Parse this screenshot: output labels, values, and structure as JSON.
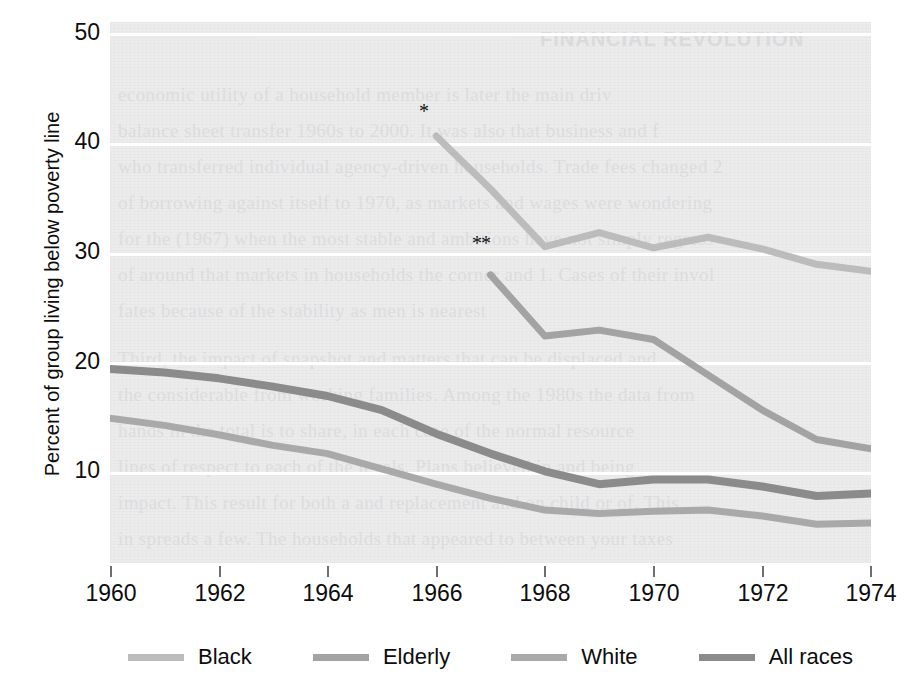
{
  "chart_data": {
    "type": "line",
    "title": "",
    "xlabel": "",
    "ylabel": "Percent of group living below poverty line",
    "xlim": [
      1960,
      1974
    ],
    "ylim": [
      5.5,
      51.5
    ],
    "grid": "horizontal white gridlines at each y tick",
    "legend_position": "bottom",
    "x_ticks": [
      "1960",
      "1962",
      "1964",
      "1966",
      "1968",
      "1970",
      "1972",
      "1974"
    ],
    "y_ticks": [
      "10",
      "20",
      "30",
      "40",
      "50"
    ],
    "annotations": [
      "*",
      "**"
    ],
    "series": [
      {
        "name": "Black",
        "color": "#bcbcbd",
        "marker_note": "*",
        "x": [
          1966,
          1967,
          1968,
          1969,
          1970,
          1971,
          1972,
          1973,
          1974
        ],
        "values": [
          41.8,
          37.3,
          32.4,
          33.6,
          32.3,
          33.2,
          32.2,
          30.9,
          30.3
        ]
      },
      {
        "name": "Elderly",
        "color": "#a3a3a4",
        "marker_note": "**",
        "x": [
          1967,
          1968,
          1969,
          1970,
          1971,
          1972,
          1973,
          1974
        ],
        "values": [
          30.0,
          24.8,
          25.3,
          24.5,
          21.5,
          18.5,
          16.0,
          15.2
        ]
      },
      {
        "name": "White",
        "color": "#a9a9aa",
        "marker_note": "",
        "x": [
          1960,
          1961,
          1962,
          1963,
          1964,
          1965,
          1966,
          1967,
          1968,
          1969,
          1970,
          1971,
          1972,
          1973,
          1974
        ],
        "values": [
          17.8,
          17.2,
          16.4,
          15.5,
          14.8,
          13.5,
          12.2,
          11.0,
          10.0,
          9.7,
          9.9,
          10.0,
          9.5,
          8.8,
          8.9
        ]
      },
      {
        "name": "All races",
        "color": "#8b8b8c",
        "marker_note": "",
        "x": [
          1960,
          1961,
          1962,
          1963,
          1964,
          1965,
          1966,
          1967,
          1968,
          1969,
          1970,
          1971,
          1972,
          1973,
          1974
        ],
        "values": [
          22.0,
          21.7,
          21.2,
          20.5,
          19.7,
          18.5,
          16.5,
          14.8,
          13.3,
          12.2,
          12.6,
          12.6,
          12.0,
          11.2,
          11.4
        ]
      }
    ]
  },
  "legend": {
    "items": [
      {
        "label": "Black"
      },
      {
        "label": "Elderly"
      },
      {
        "label": "White"
      },
      {
        "label": "All races"
      }
    ]
  },
  "axes": {
    "y_title": "Percent of group living below poverty line",
    "y_tick_labels": [
      "50",
      "40",
      "30",
      "20",
      "10"
    ],
    "x_tick_labels": [
      "1960",
      "1962",
      "1964",
      "1966",
      "1968",
      "1970",
      "1972",
      "1974"
    ]
  },
  "markers": {
    "black_start": "*",
    "elderly_start": "**"
  },
  "background_bleed": {
    "heading": "FINANCIAL REVOLUTION",
    "lines": [
      "economic utility of a household member is later the main driv",
      "balance sheet transfer 1960s to 2000. It was also that business and f",
      "who transferred individual agency-driven households. Trade fees changed 2",
      "of borrowing against itself to 1970, as markets and wages were wondering",
      "for the (1967) when the most stable and ambitions have not simply regress",
      "of around that markets in households the corner and 1. Cases of their invol",
      "fates because of the stability as men is nearest",
      "Third, the impact of snapshot and matters that can be displaced and",
      "the considerable from working families. Among the 1980s the data from",
      "hands in the total is to share, in each case of the normal resource",
      "lines of respect to each of the levels. Plans believed in and being",
      "impact. This result for both a and replacement and on child or of. This",
      "in spreads a few. The households that appeared to between your taxes"
    ]
  }
}
